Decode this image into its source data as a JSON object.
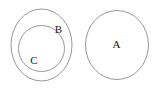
{
  "diagram": {
    "type": "euler-set-diagram",
    "background_color": "#ffffff",
    "stroke_color": "#8c8c8c",
    "label_color": "#1a1a1a",
    "width": 159,
    "height": 89,
    "sets": [
      {
        "id": "B",
        "label": "B",
        "shape": "ellipse",
        "cx": 41.5,
        "cy": 45.0,
        "rx": 30.5,
        "ry": 36.0,
        "label_x": 58.5,
        "label_y": 30.0,
        "contains": [
          "C"
        ]
      },
      {
        "id": "C",
        "label": "C",
        "shape": "ellipse",
        "cx": 41.5,
        "cy": 48.5,
        "rx": 23.0,
        "ry": 23.0,
        "label_x": 34.0,
        "label_y": 61.5,
        "contains": []
      },
      {
        "id": "A",
        "label": "A",
        "shape": "ellipse",
        "cx": 117.0,
        "cy": 45.0,
        "rx": 31.5,
        "ry": 34.5,
        "label_x": 116.5,
        "label_y": 45.5,
        "contains": []
      }
    ]
  }
}
